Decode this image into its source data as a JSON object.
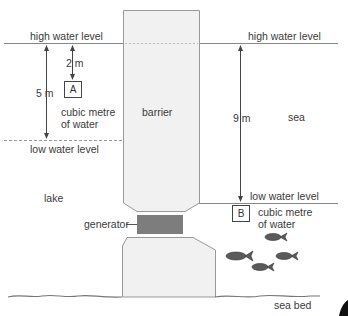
{
  "labels": {
    "high_water_left": "high water level",
    "high_water_right": "high water level",
    "low_water_left": "low water level",
    "low_water_right": "low water level",
    "depth_a": "2 m",
    "height_lake": "5 m",
    "height_sea": "9 m",
    "box_a": "A",
    "box_b": "B",
    "cube_a_line1": "cubic metre",
    "cube_a_line2": "of water",
    "cube_b_line1": "cubic metre",
    "cube_b_line2": "of water",
    "barrier": "barrier",
    "sea": "sea",
    "lake": "lake",
    "generator": "generator",
    "sea_bed": "sea bed"
  },
  "colors": {
    "barrier_fill": "#f0f0f0",
    "barrier_stroke": "#9a9a9a",
    "generator_fill": "#7a7a7a",
    "line": "#777777",
    "fish": "#555555"
  }
}
